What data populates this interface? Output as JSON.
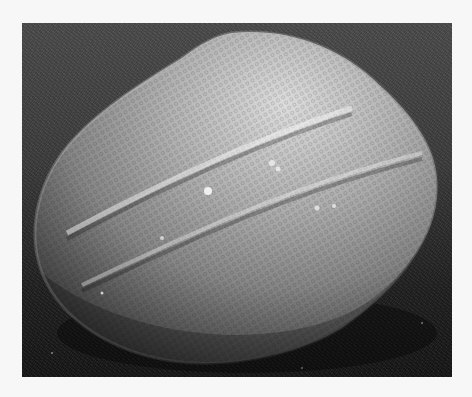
{
  "image": {
    "subject": "SEM micrograph of an ellipsoidal pollen grain with reticulate surface and colpi (furrows)",
    "grayscale": true,
    "colors": {
      "page_background": "#f7f7f7",
      "background_top": "#4a4a4a",
      "background_bottom": "#141414",
      "grain_highlight": "#d8d8d8",
      "grain_mid": "#9a9a9a",
      "grain_shadow": "#3c3c3c"
    }
  }
}
